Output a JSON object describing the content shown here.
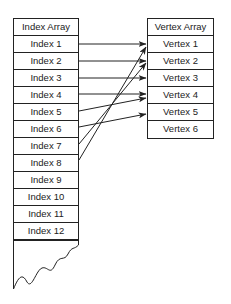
{
  "index_array": {
    "title": "Index Array",
    "items": [
      "Index 1",
      "Index 2",
      "Index 3",
      "Index 4",
      "Index 5",
      "Index 6",
      "Index 7",
      "Index 8",
      "Index 9",
      "Index 10",
      "Index 11",
      "Index 12"
    ]
  },
  "vertex_array": {
    "title": "Vertex Array",
    "items": [
      "Vertex 1",
      "Vertex 2",
      "Vertex 3",
      "Vertex 4",
      "Vertex 5",
      "Vertex 6"
    ]
  },
  "connections": [
    {
      "from": "Index 1",
      "to": "Vertex 1"
    },
    {
      "from": "Index 2",
      "to": "Vertex 2"
    },
    {
      "from": "Index 3",
      "to": "Vertex 3"
    },
    {
      "from": "Index 4",
      "to": "Vertex 4"
    },
    {
      "from": "Index 5",
      "to": "Vertex 4"
    },
    {
      "from": "Index 6",
      "to": "Vertex 5"
    },
    {
      "from": "Index 7",
      "to": "Vertex 2"
    },
    {
      "from": "Index 8",
      "to": "Vertex 1"
    }
  ],
  "colors": {
    "line": "#222222",
    "background": "#ffffff"
  }
}
